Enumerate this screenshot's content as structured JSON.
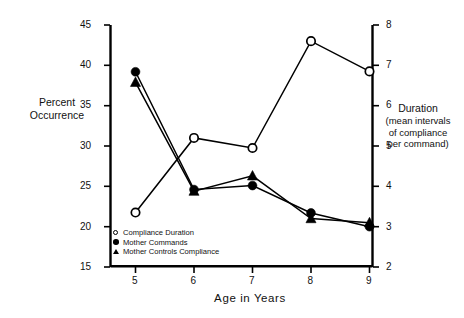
{
  "chart_data": {
    "type": "line",
    "title": "",
    "xlabel": "Age  in  Years",
    "ylabel": "Percent Occurrence",
    "ylabel_right": "Duration",
    "ylabel_right_sub": "(mean intervals of compliance per command)",
    "ylabel_right_sub_lines": [
      "(mean intervals",
      "of compliance",
      "per command)"
    ],
    "x": [
      5,
      6,
      7,
      8,
      9
    ],
    "xtick_labels": [
      "5",
      "6",
      "7",
      "8",
      "9"
    ],
    "xlim": [
      4.6,
      9.4
    ],
    "ylim": [
      15,
      45
    ],
    "ytick_labels": [
      "15",
      "20",
      "25",
      "30",
      "35",
      "40",
      "45"
    ],
    "yticks": [
      15,
      20,
      25,
      30,
      35,
      40,
      45
    ],
    "ylim_right": [
      2,
      8
    ],
    "ytick_labels_right": [
      "2",
      "3",
      "4",
      "5",
      "6",
      "7",
      "8"
    ],
    "yticks_right": [
      2,
      3,
      4,
      5,
      6,
      7,
      8
    ],
    "grid": false,
    "legend_position": "lower-left-inside",
    "series": [
      {
        "name": "Compliance Duration",
        "marker": "open-circle",
        "axis": "right",
        "values": [
          3.35,
          5.2,
          4.95,
          7.6,
          6.85
        ]
      },
      {
        "name": "Mother Commands",
        "marker": "filled-circle",
        "axis": "left",
        "values": [
          39.2,
          24.6,
          25.1,
          21.7,
          20.0
        ]
      },
      {
        "name": "Mother Controls Compliance",
        "marker": "filled-triangle",
        "axis": "left",
        "values": [
          37.9,
          24.4,
          26.3,
          21.0,
          20.5
        ]
      }
    ]
  },
  "legend": {
    "items": [
      {
        "label": "Compliance Duration",
        "marker": "open-circle"
      },
      {
        "label": "Mother Commands",
        "marker": "filled-circle"
      },
      {
        "label": "Mother Controls Compliance",
        "marker": "filled-triangle"
      }
    ]
  },
  "colors": {
    "ink": "#000000",
    "background": "#ffffff"
  }
}
